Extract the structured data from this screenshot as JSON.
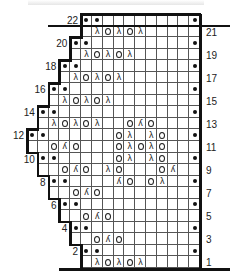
{
  "chart_data": {
    "type": "knitting-chart",
    "columns": 16,
    "rows": 22,
    "legend_symbols": {
      "dot": "purl",
      "O": "yarn-over",
      "λ": "left-leaning decrease",
      "ʎ": "right-leaning / double decrease",
      "blank": "knit"
    },
    "row_start_col": {
      "1": 5,
      "2": 5,
      "3": 4,
      "4": 4,
      "5": 3,
      "6": 3,
      "7": 2,
      "8": 2,
      "9": 1,
      "10": 1,
      "11": 0,
      "12": 0,
      "13": 1,
      "14": 1,
      "15": 2,
      "16": 2,
      "17": 3,
      "18": 3,
      "19": 4,
      "20": 4,
      "21": 5,
      "22": 5
    },
    "cells": {
      "1": {
        "6": "λ",
        "7": "O",
        "8": "λ",
        "9": "O",
        "10": "λ"
      },
      "2": {
        "5": "•",
        "6": "•",
        "15": "•"
      },
      "3": {
        "6": "O",
        "7": "ʎ",
        "8": "O"
      },
      "4": {
        "4": "•",
        "5": "•",
        "15": "•"
      },
      "5": {
        "5": "O",
        "6": "ʎ",
        "7": "O"
      },
      "6": {
        "3": "•",
        "4": "•",
        "15": "•"
      },
      "7": {
        "4": "O",
        "5": "ʎ",
        "6": "O"
      },
      "8": {
        "2": "•",
        "3": "•",
        "8": "ʎ",
        "9": "O",
        "11": "O",
        "12": "λ",
        "15": "•"
      },
      "9": {
        "3": "O",
        "4": "ʎ",
        "5": "O",
        "7": "λ",
        "8": "O",
        "12": "O",
        "13": "ʎ"
      },
      "10": {
        "1": "•",
        "2": "•",
        "8": "O",
        "9": "λ",
        "11": "λ",
        "12": "O",
        "15": "•"
      },
      "11": {
        "2": "O",
        "3": "ʎ",
        "4": "O",
        "8": "O",
        "9": "λ",
        "10": "O",
        "11": "λ",
        "12": "O"
      },
      "12": {
        "0": "•",
        "1": "•",
        "8": "O",
        "9": "λ",
        "11": "λ",
        "12": "O",
        "15": "•"
      },
      "13": {
        "2": "λ",
        "3": "O",
        "4": "λ",
        "5": "O",
        "6": "λ",
        "9": "O",
        "10": "ʎ",
        "11": "O"
      },
      "14": {
        "1": "•",
        "2": "•",
        "15": "•"
      },
      "15": {
        "3": "λ",
        "4": "O",
        "5": "λ",
        "6": "O",
        "7": "λ"
      },
      "16": {
        "2": "•",
        "3": "•",
        "15": "•"
      },
      "17": {
        "4": "λ",
        "5": "O",
        "6": "λ",
        "7": "O",
        "8": "λ"
      },
      "18": {
        "3": "•",
        "4": "•",
        "15": "•"
      },
      "19": {
        "5": "λ",
        "6": "O",
        "7": "λ",
        "8": "O",
        "9": "λ"
      },
      "20": {
        "4": "•",
        "5": "•",
        "15": "•"
      },
      "21": {
        "6": "λ",
        "7": "O",
        "8": "λ",
        "9": "O",
        "10": "λ"
      },
      "22": {
        "5": "•",
        "6": "•",
        "15": "•"
      }
    },
    "row_labels_left": [
      "2",
      "4",
      "6",
      "8",
      "10",
      "12",
      "14",
      "16",
      "18",
      "20",
      "22"
    ],
    "row_labels_right": [
      "1",
      "3",
      "5",
      "7",
      "9",
      "11",
      "13",
      "15",
      "17",
      "19",
      "21"
    ]
  },
  "layout": {
    "grid_left": 27,
    "grid_right": 200,
    "grid_top": 14,
    "grid_bottom": 268
  }
}
